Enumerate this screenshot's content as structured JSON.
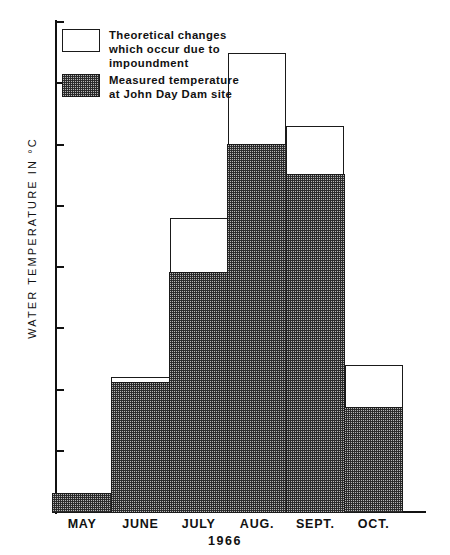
{
  "chart_data": {
    "type": "bar",
    "title": "",
    "subtitle": "",
    "xlabel": "1966",
    "ylabel": "WATER TEMPERATURE IN °C",
    "categories": [
      "MAY",
      "JUNE",
      "JULY",
      "AUG.",
      "SEPT.",
      "OCT."
    ],
    "ylim": [
      13,
      21
    ],
    "yticks": [
      13,
      14,
      15,
      16,
      17,
      18,
      19,
      20,
      21
    ],
    "ytick_labels": [
      "13",
      "14",
      "15",
      "16",
      "17",
      "18",
      "19",
      "20",
      "21"
    ],
    "grid": false,
    "legend_position": "upper-left-inside",
    "stacked": true,
    "base": 13,
    "series": [
      {
        "name": "Measured temperature at John Day Dam site",
        "style": "stippled-gray",
        "values": [
          13.3,
          15.1,
          16.9,
          19.0,
          18.5,
          14.7
        ]
      },
      {
        "name": "Theoretical changes which occur due to impoundment",
        "style": "white-outline",
        "values": [
          13.3,
          15.2,
          17.8,
          20.5,
          19.3,
          15.4
        ]
      }
    ],
    "annotations": []
  },
  "axis": {
    "y_title": "WATER TEMPERATURE IN °C",
    "ticks": [
      {
        "label": "21",
        "value": 21
      },
      {
        "label": "20",
        "value": 20
      },
      {
        "label": "19",
        "value": 19
      },
      {
        "label": "18",
        "value": 18
      },
      {
        "label": "17",
        "value": 17
      },
      {
        "label": "16",
        "value": 16
      },
      {
        "label": "15",
        "value": 15
      },
      {
        "label": "14",
        "value": 14
      },
      {
        "label": "13",
        "value": 13
      }
    ]
  },
  "x_axis": {
    "labels": [
      "MAY",
      "JUNE",
      "JULY",
      "AUG.",
      "SEPT.",
      "OCT."
    ],
    "year": "1966"
  },
  "legend": {
    "items": [
      {
        "swatch": "white-outline",
        "lines": [
          "Theoretical changes",
          "which occur due to",
          "impoundment"
        ]
      },
      {
        "swatch": "stippled-gray",
        "lines": [
          "Measured temperature",
          "at John Day Dam site"
        ]
      }
    ]
  },
  "caption": {
    "text": ""
  },
  "colors": {
    "ink": "#1a1a1a",
    "measured_fill": "#b6b6b6",
    "theoretical_fill": "#ffffff",
    "background": "#ffffff"
  }
}
